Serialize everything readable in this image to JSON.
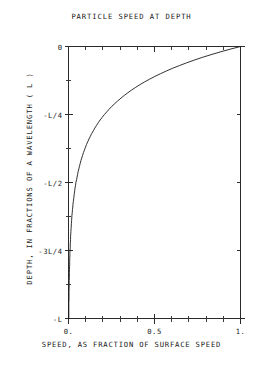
{
  "chart_data": {
    "type": "line",
    "title": "PARTICLE SPEED AT DEPTH",
    "xlabel": "SPEED, AS FRACTION OF SURFACE SPEED",
    "ylabel": "DEPTH, IN FRACTIONS OF A WAVELENGTH ( L )",
    "xlim": [
      0,
      1
    ],
    "ylim": [
      -1,
      0
    ],
    "grid": false,
    "legend": "none",
    "x_tick_labels": [
      "0.",
      "0.5",
      "1."
    ],
    "x_tick_values": [
      0,
      0.5,
      1
    ],
    "x_minor_ticks": [
      0.1,
      0.2,
      0.3,
      0.4,
      0.6,
      0.7,
      0.8,
      0.9
    ],
    "y_tick_labels": [
      "0",
      "-L/4",
      "-L/2",
      "-3L/4",
      "-L"
    ],
    "y_tick_values": [
      0,
      -0.25,
      -0.5,
      -0.75,
      -1
    ],
    "y_minor_ticks": [
      -0.125,
      -0.375,
      -0.625,
      -0.875
    ],
    "series": [
      {
        "name": "particle speed",
        "relation": "speed = exp(2*pi*depth/L)",
        "x": [
          1.0,
          0.939,
          0.882,
          0.829,
          0.778,
          0.731,
          0.687,
          0.645,
          0.606,
          0.569,
          0.535,
          0.502,
          0.472,
          0.443,
          0.416,
          0.391,
          0.367,
          0.345,
          0.324,
          0.305,
          0.286,
          0.269,
          0.252,
          0.237,
          0.223,
          0.209,
          0.196,
          0.184,
          0.173,
          0.163,
          0.153,
          0.144,
          0.135,
          0.127,
          0.119,
          0.112,
          0.105,
          0.099,
          0.093,
          0.087,
          0.082,
          0.077,
          0.072,
          0.068,
          0.064,
          0.06,
          0.056,
          0.053,
          0.05,
          0.047,
          0.043,
          0.041,
          0.038,
          0.036,
          0.034,
          0.032,
          0.03,
          0.028,
          0.026,
          0.025,
          0.023,
          0.022,
          0.02,
          0.019,
          0.018,
          0.017,
          0.016,
          0.015,
          0.014,
          0.013,
          0.012,
          0.012,
          0.011,
          0.01,
          0.01,
          0.009,
          0.008,
          0.008,
          0.007,
          0.007,
          0.007,
          0.006,
          0.006,
          0.005,
          0.005,
          0.005,
          0.004,
          0.004,
          0.004,
          0.004,
          0.003,
          0.003,
          0.003,
          0.003,
          0.002,
          0.002,
          0.002,
          0.002,
          0.002,
          0.002,
          0.002
        ],
        "y": [
          0.0,
          -0.01,
          -0.02,
          -0.03,
          -0.04,
          -0.05,
          -0.06,
          -0.07,
          -0.08,
          -0.09,
          -0.1,
          -0.11,
          -0.12,
          -0.13,
          -0.14,
          -0.15,
          -0.16,
          -0.17,
          -0.18,
          -0.19,
          -0.2,
          -0.21,
          -0.22,
          -0.23,
          -0.24,
          -0.25,
          -0.26,
          -0.27,
          -0.28,
          -0.29,
          -0.3,
          -0.31,
          -0.32,
          -0.33,
          -0.34,
          -0.35,
          -0.36,
          -0.37,
          -0.38,
          -0.39,
          -0.4,
          -0.41,
          -0.42,
          -0.43,
          -0.44,
          -0.45,
          -0.46,
          -0.47,
          -0.48,
          -0.49,
          -0.5,
          -0.51,
          -0.52,
          -0.53,
          -0.54,
          -0.55,
          -0.56,
          -0.57,
          -0.58,
          -0.59,
          -0.6,
          -0.61,
          -0.62,
          -0.63,
          -0.64,
          -0.65,
          -0.66,
          -0.67,
          -0.68,
          -0.69,
          -0.7,
          -0.71,
          -0.72,
          -0.73,
          -0.74,
          -0.75,
          -0.76,
          -0.77,
          -0.78,
          -0.79,
          -0.8,
          -0.81,
          -0.82,
          -0.83,
          -0.84,
          -0.85,
          -0.86,
          -0.87,
          -0.88,
          -0.89,
          -0.9,
          -0.91,
          -0.92,
          -0.93,
          -0.94,
          -0.95,
          -0.96,
          -0.97,
          -0.98,
          -0.99,
          -1.0
        ]
      }
    ]
  },
  "colors": {
    "curve": "#1a1a1a",
    "axis": "#2b2b2b",
    "background": "#ffffff",
    "text": "#1a1a1a"
  }
}
